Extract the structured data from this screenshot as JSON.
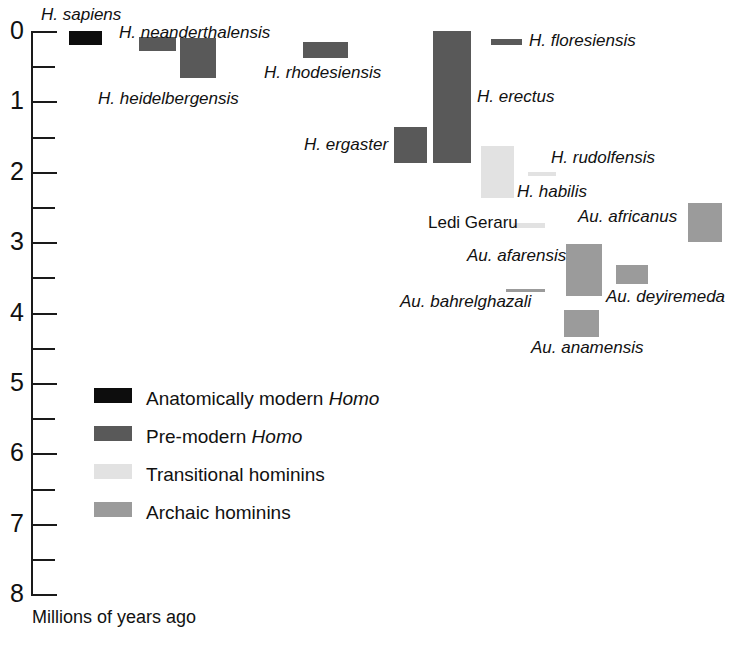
{
  "chart_data": {
    "type": "bar",
    "orientation": "vertical-ranges",
    "title": "",
    "xlabel": "",
    "ylabel": "Millions of years ago",
    "ylim": [
      0,
      8
    ],
    "y_inverted": true,
    "grid": false,
    "axis": {
      "title": "Millions of years ago",
      "major_ticks": [
        "0",
        "1",
        "2",
        "3",
        "4",
        "5",
        "6",
        "7",
        "8"
      ],
      "minor_tick_step": 0.5,
      "unit": "Ma"
    },
    "legend": {
      "position": "inside-lower-left",
      "entries": [
        {
          "key": "modern",
          "label_plain": "Anatomically modern ",
          "label_italic": "Homo",
          "color": "#0d0d0d"
        },
        {
          "key": "premodern",
          "label_plain": "Pre-modern ",
          "label_italic": "Homo",
          "color": "#595959"
        },
        {
          "key": "transitional",
          "label_plain": "Transitional hominins",
          "label_italic": "",
          "color": "#e2e2e2"
        },
        {
          "key": "archaic",
          "label_plain": "Archaic hominins",
          "label_italic": "",
          "color": "#9b9b9b"
        }
      ]
    },
    "taxa": [
      {
        "name": "H. sapiens",
        "group": "modern",
        "start_ma": 0.2,
        "end_ma": 0.0,
        "x_px": 69,
        "w_px": 33,
        "label_x": 41,
        "label_y": 6,
        "italic": true
      },
      {
        "name": "H. neanderthalensis",
        "group": "premodern",
        "start_ma": 0.29,
        "end_ma": 0.09,
        "x_px": 139,
        "w_px": 37,
        "label_x": 119,
        "label_y": 24,
        "italic": true
      },
      {
        "name": "H. heidelbergensis",
        "group": "premodern",
        "start_ma": 0.67,
        "end_ma": 0.1,
        "x_px": 180,
        "w_px": 36,
        "label_x": 98,
        "label_y": 90,
        "italic": true
      },
      {
        "name": "H. rhodesiensis",
        "group": "premodern",
        "start_ma": 0.39,
        "end_ma": 0.16,
        "x_px": 303,
        "w_px": 45,
        "label_x": 264,
        "label_y": 64,
        "italic": true
      },
      {
        "name": "H. floresiensis",
        "group": "premodern",
        "start_ma": 0.2,
        "end_ma": 0.11,
        "x_px": 491,
        "w_px": 31,
        "label_x": 529,
        "label_y": 32,
        "italic": true
      },
      {
        "name": "H. erectus",
        "group": "premodern",
        "start_ma": 1.88,
        "end_ma": 0.0,
        "x_px": 433,
        "w_px": 38,
        "label_x": 477,
        "label_y": 88,
        "italic": true
      },
      {
        "name": "H. ergaster",
        "group": "premodern",
        "start_ma": 1.88,
        "end_ma": 1.37,
        "x_px": 394,
        "w_px": 33,
        "label_x": 304,
        "label_y": 136,
        "italic": true
      },
      {
        "name": "H. habilis",
        "group": "transitional",
        "start_ma": 2.37,
        "end_ma": 1.64,
        "x_px": 481,
        "w_px": 33,
        "label_x": 517,
        "label_y": 183,
        "italic": true
      },
      {
        "name": "H. rudolfensis",
        "group": "transitional",
        "start_ma": 2.06,
        "end_ma": 2.0,
        "x_px": 528,
        "w_px": 28,
        "label_x": 551,
        "label_y": 149,
        "italic": true
      },
      {
        "name": "Ledi Geraru",
        "group": "transitional",
        "start_ma": 2.8,
        "end_ma": 2.73,
        "x_px": 513,
        "w_px": 32,
        "label_x": 428,
        "label_y": 214,
        "italic": false
      },
      {
        "name": "Au. africanus",
        "group": "archaic",
        "start_ma": 3.0,
        "end_ma": 2.45,
        "x_px": 688,
        "w_px": 34,
        "label_x": 578,
        "label_y": 208,
        "italic": true
      },
      {
        "name": "Au. afarensis",
        "group": "archaic",
        "start_ma": 3.76,
        "end_ma": 3.03,
        "x_px": 566,
        "w_px": 36,
        "label_x": 467,
        "label_y": 247,
        "italic": true
      },
      {
        "name": "Au. deyiremeda",
        "group": "archaic",
        "start_ma": 3.6,
        "end_ma": 3.33,
        "x_px": 616,
        "w_px": 32,
        "label_x": 606,
        "label_y": 288,
        "italic": true
      },
      {
        "name": "Au. bahrelghazali",
        "group": "archaic",
        "start_ma": 3.71,
        "end_ma": 3.67,
        "x_px": 506,
        "w_px": 39,
        "label_x": 400,
        "label_y": 293,
        "italic": true
      },
      {
        "name": "Au. anamensis",
        "group": "archaic",
        "start_ma": 4.34,
        "end_ma": 3.96,
        "x_px": 564,
        "w_px": 35,
        "label_x": 531,
        "label_y": 339,
        "italic": true
      }
    ]
  }
}
